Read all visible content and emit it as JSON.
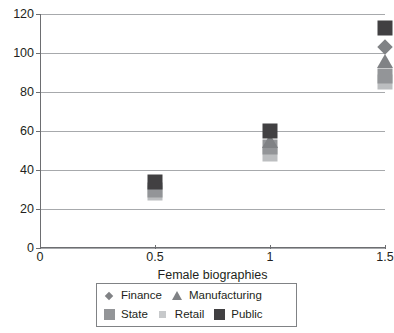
{
  "chart_data": {
    "type": "scatter",
    "title": "",
    "xlabel": "Female biographies",
    "ylabel": "",
    "xlim": [
      0,
      1.5
    ],
    "ylim": [
      0,
      120
    ],
    "x_ticks": [
      "0",
      "0.5",
      "1",
      "1.5"
    ],
    "x_tick_values": [
      0,
      0.5,
      1,
      1.5
    ],
    "y_ticks": [
      "0",
      "20",
      "40",
      "60",
      "80",
      "100",
      "120"
    ],
    "y_tick_values": [
      0,
      20,
      40,
      60,
      80,
      100,
      120
    ],
    "grid": "horizontal",
    "legend_position": "bottom",
    "x": [
      0.5,
      1,
      1.5
    ],
    "series": [
      {
        "name": "Finance",
        "marker": "diamond",
        "color": "#808285",
        "values": [
          null,
          null,
          103
        ]
      },
      {
        "name": "Manufacturing",
        "marker": "triangle",
        "color": "#808285",
        "values": [
          null,
          55,
          96
        ]
      },
      {
        "name": "State",
        "marker": "square",
        "color": "#939598",
        "values": [
          30,
          52,
          88
        ]
      },
      {
        "name": "Retail",
        "marker": "square",
        "color": "#bcbec0",
        "values": [
          28,
          48,
          85
        ]
      },
      {
        "name": "Public",
        "marker": "square",
        "color": "#414042",
        "values": [
          34,
          60,
          113
        ]
      }
    ]
  },
  "legend": {
    "items": [
      {
        "label": "Finance",
        "marker": "diamond",
        "color": "#808285"
      },
      {
        "label": "Manufacturing",
        "marker": "triangle",
        "color": "#808285"
      },
      {
        "label": "State",
        "marker": "square",
        "color": "#939598"
      },
      {
        "label": "Retail",
        "marker": "square-small",
        "color": "#c7c9cb"
      },
      {
        "label": "Public",
        "marker": "square",
        "color": "#414042"
      }
    ]
  },
  "colors": {
    "axis": "#6d6e71",
    "grid": "#a7a9ac",
    "text": "#231f20",
    "legend_border": "#808285",
    "background": "#ffffff"
  }
}
